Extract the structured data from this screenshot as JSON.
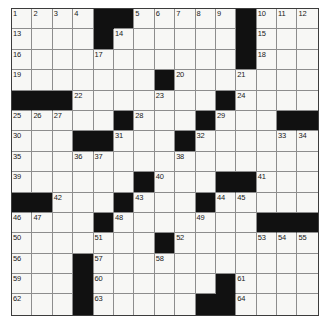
{
  "puzzle": {
    "title": "Crossword Grid",
    "rows": 15,
    "cols": 15,
    "colors": {
      "block": "#111111",
      "cell": "#f7f7f5",
      "gridline": "#8d8d8d",
      "border": "#3c3c3c",
      "number": "#1a1a1a",
      "page_background": "#ffffff"
    },
    "grid": [
      [
        {
          "t": "w",
          "n": "1"
        },
        {
          "t": "w",
          "n": "2"
        },
        {
          "t": "w",
          "n": "3"
        },
        {
          "t": "w",
          "n": "4"
        },
        {
          "t": "b"
        },
        {
          "t": "b"
        },
        {
          "t": "w",
          "n": "5"
        },
        {
          "t": "w",
          "n": "6"
        },
        {
          "t": "w",
          "n": "7"
        },
        {
          "t": "w",
          "n": "8"
        },
        {
          "t": "w",
          "n": "9"
        },
        {
          "t": "b"
        },
        {
          "t": "w",
          "n": "10"
        },
        {
          "t": "w",
          "n": "11"
        },
        {
          "t": "w",
          "n": "12"
        }
      ],
      [
        {
          "t": "w",
          "n": "13"
        },
        {
          "t": "w"
        },
        {
          "t": "w"
        },
        {
          "t": "w"
        },
        {
          "t": "b"
        },
        {
          "t": "w",
          "n": "14"
        },
        {
          "t": "w"
        },
        {
          "t": "w"
        },
        {
          "t": "w"
        },
        {
          "t": "w"
        },
        {
          "t": "w"
        },
        {
          "t": "b"
        },
        {
          "t": "w",
          "n": "15"
        },
        {
          "t": "w"
        },
        {
          "t": "w"
        }
      ],
      [
        {
          "t": "w",
          "n": "16"
        },
        {
          "t": "w"
        },
        {
          "t": "w"
        },
        {
          "t": "w"
        },
        {
          "t": "w",
          "n": "17"
        },
        {
          "t": "w"
        },
        {
          "t": "w"
        },
        {
          "t": "w"
        },
        {
          "t": "w"
        },
        {
          "t": "w"
        },
        {
          "t": "w"
        },
        {
          "t": "b"
        },
        {
          "t": "w",
          "n": "18"
        },
        {
          "t": "w"
        },
        {
          "t": "w"
        }
      ],
      [
        {
          "t": "w",
          "n": "19"
        },
        {
          "t": "w"
        },
        {
          "t": "w"
        },
        {
          "t": "w"
        },
        {
          "t": "w"
        },
        {
          "t": "w"
        },
        {
          "t": "w"
        },
        {
          "t": "b"
        },
        {
          "t": "w",
          "n": "20"
        },
        {
          "t": "w"
        },
        {
          "t": "w"
        },
        {
          "t": "w",
          "n": "21"
        },
        {
          "t": "w"
        },
        {
          "t": "w"
        },
        {
          "t": "w"
        }
      ],
      [
        {
          "t": "b"
        },
        {
          "t": "b"
        },
        {
          "t": "b"
        },
        {
          "t": "w",
          "n": "22"
        },
        {
          "t": "w"
        },
        {
          "t": "w"
        },
        {
          "t": "w"
        },
        {
          "t": "w",
          "n": "23"
        },
        {
          "t": "w"
        },
        {
          "t": "w"
        },
        {
          "t": "b"
        },
        {
          "t": "w",
          "n": "24"
        },
        {
          "t": "w"
        },
        {
          "t": "w"
        },
        {
          "t": "w"
        }
      ],
      [
        {
          "t": "w",
          "n": "25"
        },
        {
          "t": "w",
          "n": "26"
        },
        {
          "t": "w",
          "n": "27"
        },
        {
          "t": "w"
        },
        {
          "t": "w"
        },
        {
          "t": "b"
        },
        {
          "t": "w",
          "n": "28"
        },
        {
          "t": "w"
        },
        {
          "t": "w"
        },
        {
          "t": "b"
        },
        {
          "t": "w",
          "n": "29"
        },
        {
          "t": "w"
        },
        {
          "t": "w"
        },
        {
          "t": "b"
        },
        {
          "t": "b"
        }
      ],
      [
        {
          "t": "w",
          "n": "30"
        },
        {
          "t": "w"
        },
        {
          "t": "w"
        },
        {
          "t": "b"
        },
        {
          "t": "b"
        },
        {
          "t": "w",
          "n": "31"
        },
        {
          "t": "w"
        },
        {
          "t": "w"
        },
        {
          "t": "b"
        },
        {
          "t": "w",
          "n": "32"
        },
        {
          "t": "w"
        },
        {
          "t": "w"
        },
        {
          "t": "w"
        },
        {
          "t": "w",
          "n": "33"
        },
        {
          "t": "w",
          "n": "34"
        }
      ],
      [
        {
          "t": "w",
          "n": "35"
        },
        {
          "t": "w"
        },
        {
          "t": "w"
        },
        {
          "t": "w",
          "n": "36"
        },
        {
          "t": "w",
          "n": "37"
        },
        {
          "t": "w"
        },
        {
          "t": "w"
        },
        {
          "t": "w"
        },
        {
          "t": "w",
          "n": "38"
        },
        {
          "t": "w"
        },
        {
          "t": "w"
        },
        {
          "t": "w"
        },
        {
          "t": "w"
        },
        {
          "t": "w"
        },
        {
          "t": "w"
        }
      ],
      [
        {
          "t": "w",
          "n": "39"
        },
        {
          "t": "w"
        },
        {
          "t": "w"
        },
        {
          "t": "w"
        },
        {
          "t": "w"
        },
        {
          "t": "w"
        },
        {
          "t": "b"
        },
        {
          "t": "w",
          "n": "40"
        },
        {
          "t": "w"
        },
        {
          "t": "w"
        },
        {
          "t": "b"
        },
        {
          "t": "b"
        },
        {
          "t": "w",
          "n": "41"
        },
        {
          "t": "w"
        },
        {
          "t": "w"
        }
      ],
      [
        {
          "t": "b"
        },
        {
          "t": "b"
        },
        {
          "t": "w",
          "n": "42"
        },
        {
          "t": "w"
        },
        {
          "t": "w"
        },
        {
          "t": "b"
        },
        {
          "t": "w",
          "n": "43"
        },
        {
          "t": "w"
        },
        {
          "t": "w"
        },
        {
          "t": "b"
        },
        {
          "t": "w",
          "n": "44"
        },
        {
          "t": "w",
          "n": "45"
        },
        {
          "t": "w"
        },
        {
          "t": "w"
        },
        {
          "t": "w"
        }
      ],
      [
        {
          "t": "w",
          "n": "46"
        },
        {
          "t": "w",
          "n": "47"
        },
        {
          "t": "w"
        },
        {
          "t": "w"
        },
        {
          "t": "b"
        },
        {
          "t": "w",
          "n": "48"
        },
        {
          "t": "w"
        },
        {
          "t": "w"
        },
        {
          "t": "w"
        },
        {
          "t": "w",
          "n": "49"
        },
        {
          "t": "w"
        },
        {
          "t": "w"
        },
        {
          "t": "b"
        },
        {
          "t": "b"
        },
        {
          "t": "b"
        }
      ],
      [
        {
          "t": "w",
          "n": "50"
        },
        {
          "t": "w"
        },
        {
          "t": "w"
        },
        {
          "t": "w"
        },
        {
          "t": "w",
          "n": "51"
        },
        {
          "t": "w"
        },
        {
          "t": "w"
        },
        {
          "t": "b"
        },
        {
          "t": "w",
          "n": "52"
        },
        {
          "t": "w"
        },
        {
          "t": "w"
        },
        {
          "t": "w"
        },
        {
          "t": "w",
          "n": "53"
        },
        {
          "t": "w",
          "n": "54"
        },
        {
          "t": "w",
          "n": "55"
        }
      ],
      [
        {
          "t": "w",
          "n": "56"
        },
        {
          "t": "w"
        },
        {
          "t": "w"
        },
        {
          "t": "b"
        },
        {
          "t": "w",
          "n": "57"
        },
        {
          "t": "w"
        },
        {
          "t": "w"
        },
        {
          "t": "w",
          "n": "58"
        },
        {
          "t": "w"
        },
        {
          "t": "w"
        },
        {
          "t": "w"
        },
        {
          "t": "w"
        },
        {
          "t": "w"
        },
        {
          "t": "w"
        },
        {
          "t": "w"
        }
      ],
      [
        {
          "t": "w",
          "n": "59"
        },
        {
          "t": "w"
        },
        {
          "t": "w"
        },
        {
          "t": "b"
        },
        {
          "t": "w",
          "n": "60"
        },
        {
          "t": "w"
        },
        {
          "t": "w"
        },
        {
          "t": "w"
        },
        {
          "t": "w"
        },
        {
          "t": "w"
        },
        {
          "t": "b"
        },
        {
          "t": "w",
          "n": "61"
        },
        {
          "t": "w"
        },
        {
          "t": "w"
        },
        {
          "t": "w"
        }
      ],
      [
        {
          "t": "w",
          "n": "62"
        },
        {
          "t": "w"
        },
        {
          "t": "w"
        },
        {
          "t": "b"
        },
        {
          "t": "w",
          "n": "63"
        },
        {
          "t": "w"
        },
        {
          "t": "w"
        },
        {
          "t": "w"
        },
        {
          "t": "w"
        },
        {
          "t": "b"
        },
        {
          "t": "b"
        },
        {
          "t": "w",
          "n": "64"
        },
        {
          "t": "w"
        },
        {
          "t": "w"
        },
        {
          "t": "w"
        }
      ]
    ]
  }
}
